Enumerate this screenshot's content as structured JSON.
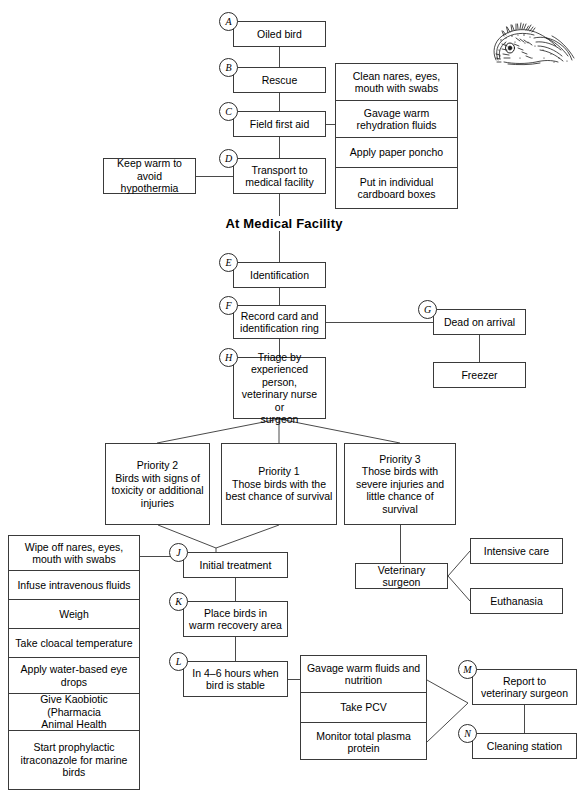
{
  "heading": {
    "medical_facility": "At Medical Facility"
  },
  "illustration": {
    "name": "oiled-bird-sketch",
    "alt": "ink sketch of an oiled bird"
  },
  "markers": {
    "a": "A",
    "b": "B",
    "c": "C",
    "d": "D",
    "e": "E",
    "f": "F",
    "g": "G",
    "h": "H",
    "j": "J",
    "k": "K",
    "l": "L",
    "m": "M",
    "n": "N"
  },
  "nodes": {
    "oiled_bird": "Oiled bird",
    "rescue": "Rescue",
    "field_first_aid": "Field first aid",
    "transport": "Transport to\nmedical facility",
    "keep_warm": "Keep warm to avoid\nhypothermia",
    "identification": "Identification",
    "record_card": "Record card and\nidentification ring",
    "dead_on_arrival": "Dead on arrival",
    "freezer": "Freezer",
    "triage": "Triage by\nexperienced person,\nveterinary nurse or\nsurgeon",
    "initial_treatment": "Initial treatment",
    "place_birds": "Place birds in\nwarm recovery area",
    "in_4_6_hours": "In 4–6 hours when\nbird is stable",
    "veterinary_surgeon": "Veterinary surgeon",
    "intensive_care": "Intensive care",
    "euthanasia": "Euthanasia",
    "report_to_vet": "Report to\nveterinary surgeon",
    "cleaning_station": "Cleaning station"
  },
  "priorities": [
    {
      "title": "Priority 2",
      "desc": "Birds with signs of\ntoxicity or additional\ninjuries"
    },
    {
      "title": "Priority 1",
      "desc": "Those birds with the\nbest chance of survival"
    },
    {
      "title": "Priority 3",
      "desc": "Those birds with\nsevere injuries and\nlittle chance of survival"
    }
  ],
  "field_first_aid_steps": [
    "Clean nares, eyes,\nmouth with swabs",
    "Gavage warm\nrehydration fluids",
    "Apply paper poncho",
    "Put in individual\ncardboard boxes"
  ],
  "initial_treatment_steps": [
    "Wipe off nares, eyes,\nmouth with swabs",
    "Infuse intravenous fluids",
    "Weigh",
    "Take cloacal temperature",
    "Apply water-based eye\ndrops",
    "Give Kaobiotic (Pharmacia\nAnimal Health",
    "Start prophylactic\nitraconazole for marine\nbirds"
  ],
  "stable_steps": [
    "Gavage warm fluids and\nnutrition",
    "Take PCV",
    "Monitor total plasma\nprotein"
  ],
  "colors": {
    "line": "#4a4a4a",
    "border": "#3a3a3a",
    "text": "#000000",
    "background": "#ffffff"
  }
}
